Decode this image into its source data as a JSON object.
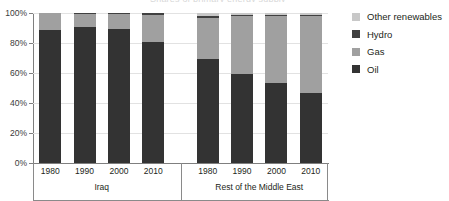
{
  "title_sliver": "Shares of primary energy supply",
  "chart_data": {
    "type": "bar",
    "stacked": true,
    "stacked_mode": "percent",
    "title": "",
    "xlabel": "",
    "ylabel": "",
    "ylim": [
      0,
      100
    ],
    "yticks": [
      0,
      20,
      40,
      60,
      80,
      100
    ],
    "ytick_labels": [
      "0%",
      "20%",
      "40%",
      "60%",
      "80%",
      "100%"
    ],
    "grid": true,
    "grid_axis": "y",
    "legend_position": "right",
    "groups": [
      {
        "label": "Iraq",
        "categories": [
          "1980",
          "1990",
          "2000",
          "2010"
        ]
      },
      {
        "label": "Rest of the Middle East",
        "categories": [
          "1980",
          "1990",
          "2000",
          "2010"
        ]
      }
    ],
    "categories": [
      "1980",
      "1990",
      "2000",
      "2010",
      "1980",
      "1990",
      "2000",
      "2010"
    ],
    "series": [
      {
        "name": "Oil",
        "color": "#333333",
        "values": [
          88.5,
          90.5,
          89.5,
          81.0,
          69.5,
          59.5,
          53.5,
          46.5
        ]
      },
      {
        "name": "Gas",
        "color": "#a0a0a0",
        "values": [
          11.5,
          9.0,
          10.0,
          18.0,
          27.0,
          38.5,
          44.5,
          51.5
        ]
      },
      {
        "name": "Hydro",
        "color": "#404040",
        "values": [
          0.0,
          0.5,
          0.5,
          1.0,
          1.5,
          0.5,
          0.5,
          0.5
        ]
      },
      {
        "name": "Other renewables",
        "color": "#c8c8c8",
        "values": [
          0.0,
          0.0,
          0.0,
          0.0,
          2.0,
          1.5,
          1.5,
          1.5
        ]
      }
    ]
  },
  "legend": {
    "items": [
      {
        "label": "Other renewables",
        "color": "#c8c8c8"
      },
      {
        "label": "Hydro",
        "color": "#404040"
      },
      {
        "label": "Gas",
        "color": "#a0a0a0"
      },
      {
        "label": "Oil",
        "color": "#333333"
      }
    ]
  }
}
